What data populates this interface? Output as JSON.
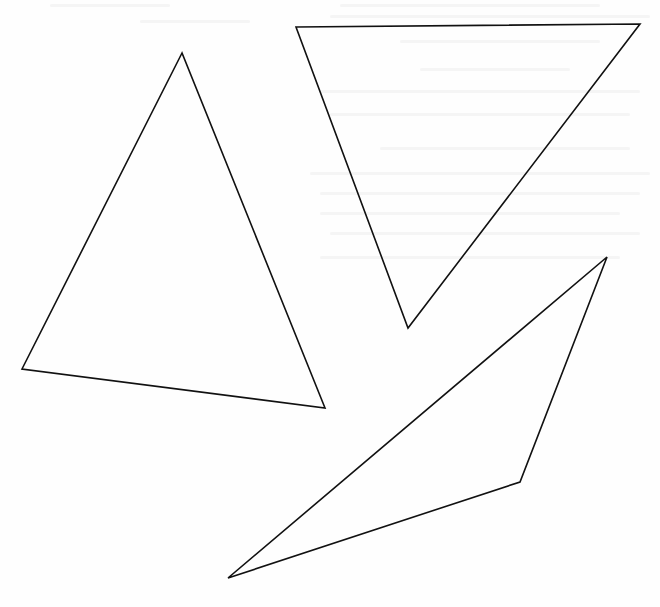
{
  "figure": {
    "background": "#ffffff",
    "stroke_color": "#111111",
    "shapes": [
      {
        "name": "triangle-left",
        "type": "triangle",
        "points": [
          [
            182,
            53
          ],
          [
            22,
            369
          ],
          [
            325,
            408
          ]
        ]
      },
      {
        "name": "triangle-upper-right",
        "type": "triangle",
        "points": [
          [
            296,
            27
          ],
          [
            640,
            24
          ],
          [
            408,
            328
          ]
        ]
      },
      {
        "name": "triangle-lower-right",
        "type": "triangle",
        "points": [
          [
            607,
            257
          ],
          [
            520,
            482
          ],
          [
            228,
            578
          ]
        ]
      }
    ]
  }
}
